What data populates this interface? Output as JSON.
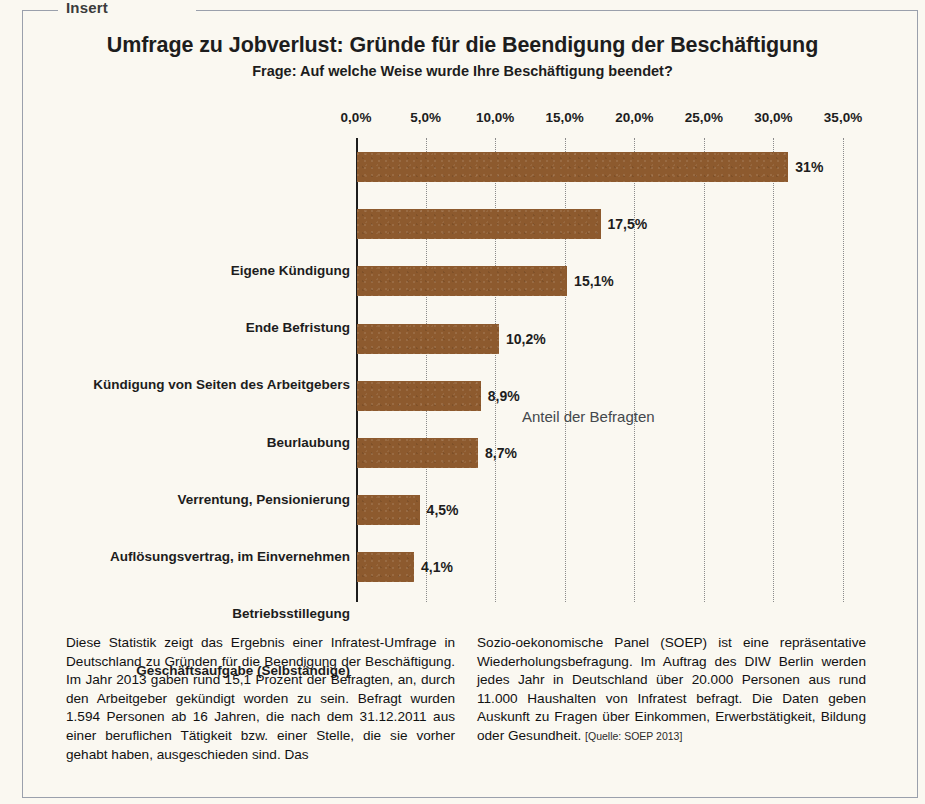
{
  "frame": {
    "legend": "Insert"
  },
  "header": {
    "title": "Umfrage zu Jobverlust: Gründe für die Beendigung der Beschäftigung",
    "subtitle": "Frage: Auf welche Weise wurde Ihre Beschäftigung beendet?"
  },
  "legend": {
    "series_label": "Anteil der Befragten"
  },
  "colors": {
    "bar": "#8d5a2e",
    "text": "#1d1d1d",
    "grid": "#8b8b8b",
    "page_background": "#faf8f1",
    "frame_border": "#9aa0ac"
  },
  "chart_data": {
    "type": "bar",
    "orientation": "horizontal",
    "title": "Umfrage zu Jobverlust: Gründe für die Beendigung der Beschäftigung",
    "subtitle": "Frage: Auf welche Weise wurde Ihre Beschäftigung beendet?",
    "xlabel": "",
    "ylabel": "",
    "xlim": [
      0,
      35
    ],
    "grid": true,
    "legend_position": "inside-right",
    "series": [
      {
        "name": "Anteil der Befragten",
        "values": [
          31.0,
          17.5,
          15.1,
          10.2,
          8.9,
          8.7,
          4.5,
          4.1
        ]
      }
    ],
    "categories": [
      "Eigene Kündigung",
      "Ende Befristung",
      "Kündigung von Seiten des Arbeitgebers",
      "Beurlaubung",
      "Verrentung, Pensionierung",
      "Auflösungsvertrag, im Einvernehmen",
      "Betriebsstillegung",
      "Geschäftsaufgabe (Selbständige)"
    ],
    "data_labels": [
      "31%",
      "17,5%",
      "15,1%",
      "10,2%",
      "8,9%",
      "8,7%",
      "4,5%",
      "4,1%"
    ],
    "xticks": [
      0,
      5,
      10,
      15,
      20,
      25,
      30,
      35
    ],
    "xtick_labels": [
      "0,0%",
      "5,0%",
      "10,0%",
      "15,0%",
      "20,0%",
      "25,0%",
      "30,0%",
      "35,0%"
    ]
  },
  "body": {
    "column_left": "Diese Statistik zeigt das Ergebnis einer Infratest-Umfrage in Deutschland zu Gründen für die Beendigung der Beschäftigung. Im Jahr 2013 gaben rund 15,1 Prozent der Befragten, an, durch den Arbeitgeber gekündigt worden zu sein. Befragt wurden 1.594 Personen ab 16 Jahren, die nach dem 31.12.2011 aus einer beruflichen Tätigkeit bzw. einer Stelle, die sie vorher gehabt haben, ausgeschieden sind. Das",
    "column_right": "Sozio-oekonomische Panel (SOEP) ist eine repräsentative Wiederholungsbefragung. Im Auftrag des DIW Berlin werden jedes Jahr in Deutschland über 20.000 Personen aus rund 11.000 Haushalten von Infratest befragt. Die Daten geben Auskunft zu Fragen über Einkommen, Erwerbstätigkeit, Bildung oder Gesundheit.",
    "source": "[Quelle: SOEP 2013]"
  }
}
